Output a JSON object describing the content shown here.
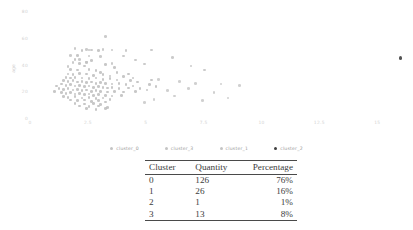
{
  "chart_data": {
    "type": "scatter",
    "title": "",
    "xlabel": "",
    "ylabel": "age",
    "xlim": [
      0,
      16.2
    ],
    "ylim": [
      0,
      84
    ],
    "xticks": [
      "0",
      "2.5",
      "5",
      "7.5",
      "10",
      "12.5",
      "15"
    ],
    "xtick_values": [
      0,
      2.5,
      5,
      7.5,
      10,
      12.5,
      15
    ],
    "yticks": [
      "80",
      "60",
      "40",
      "20",
      "0"
    ],
    "ytick_values": [
      80,
      60,
      40,
      20,
      0
    ],
    "grid": false,
    "legend_position": "bottom",
    "series": [
      {
        "name": "cluster_0",
        "color": "#bdbdbd",
        "points": [
          [
            1.95,
            44.0
          ],
          [
            2.15,
            41.0
          ],
          [
            2.45,
            41.5
          ],
          [
            2.35,
            39.0
          ],
          [
            1.75,
            36.5
          ],
          [
            2.05,
            36.0
          ],
          [
            2.55,
            36.5
          ],
          [
            2.85,
            35.5
          ],
          [
            3.05,
            34.0
          ],
          [
            1.65,
            33.0
          ],
          [
            1.85,
            32.5
          ],
          [
            2.15,
            33.5
          ],
          [
            2.45,
            33.0
          ],
          [
            2.75,
            32.0
          ],
          [
            3.15,
            32.5
          ],
          [
            3.45,
            31.5
          ],
          [
            1.55,
            30.5
          ],
          [
            1.75,
            30.0
          ],
          [
            1.95,
            30.5
          ],
          [
            2.25,
            30.0
          ],
          [
            2.55,
            29.5
          ],
          [
            2.85,
            30.0
          ],
          [
            3.15,
            29.0
          ],
          [
            3.45,
            29.5
          ],
          [
            3.75,
            28.5
          ],
          [
            1.45,
            28.0
          ],
          [
            1.65,
            27.5
          ],
          [
            1.85,
            28.0
          ],
          [
            2.05,
            27.0
          ],
          [
            2.25,
            27.5
          ],
          [
            2.45,
            26.5
          ],
          [
            2.65,
            27.0
          ],
          [
            2.85,
            26.0
          ],
          [
            3.05,
            26.5
          ],
          [
            3.25,
            26.0
          ],
          [
            3.55,
            25.5
          ],
          [
            3.85,
            26.0
          ],
          [
            4.15,
            25.0
          ],
          [
            1.35,
            25.5
          ],
          [
            1.55,
            24.5
          ],
          [
            1.75,
            25.0
          ],
          [
            1.95,
            24.0
          ],
          [
            2.15,
            24.5
          ],
          [
            2.35,
            23.5
          ],
          [
            2.55,
            24.0
          ],
          [
            2.75,
            23.0
          ],
          [
            2.95,
            23.5
          ],
          [
            3.15,
            23.0
          ],
          [
            3.35,
            22.5
          ],
          [
            3.55,
            23.0
          ],
          [
            3.85,
            22.0
          ],
          [
            4.25,
            22.5
          ],
          [
            1.25,
            22.0
          ],
          [
            1.45,
            21.5
          ],
          [
            1.65,
            22.0
          ],
          [
            1.85,
            21.0
          ],
          [
            2.05,
            21.5
          ],
          [
            2.25,
            20.5
          ],
          [
            2.45,
            21.0
          ],
          [
            2.65,
            20.0
          ],
          [
            2.85,
            20.5
          ],
          [
            3.05,
            20.0
          ],
          [
            3.35,
            19.5
          ],
          [
            3.65,
            20.0
          ],
          [
            4.05,
            19.5
          ],
          [
            4.55,
            20.0
          ],
          [
            1.35,
            19.0
          ],
          [
            1.55,
            18.5
          ],
          [
            1.75,
            19.0
          ],
          [
            1.95,
            18.0
          ],
          [
            2.15,
            18.5
          ],
          [
            2.35,
            17.5
          ],
          [
            2.55,
            18.0
          ],
          [
            2.75,
            17.0
          ],
          [
            2.95,
            17.5
          ],
          [
            3.25,
            17.0
          ],
          [
            3.55,
            16.5
          ],
          [
            3.95,
            17.0
          ],
          [
            1.45,
            16.0
          ],
          [
            1.65,
            15.5
          ],
          [
            1.95,
            16.0
          ],
          [
            2.25,
            15.0
          ],
          [
            2.55,
            15.5
          ],
          [
            2.85,
            14.5
          ],
          [
            3.15,
            15.0
          ],
          [
            3.45,
            14.0
          ],
          [
            1.75,
            13.5
          ],
          [
            2.05,
            13.0
          ],
          [
            2.35,
            13.5
          ],
          [
            2.65,
            12.5
          ],
          [
            2.95,
            13.0
          ],
          [
            3.25,
            12.0
          ],
          [
            1.95,
            11.0
          ],
          [
            2.35,
            10.5
          ],
          [
            2.75,
            11.0
          ],
          [
            3.05,
            10.0
          ],
          [
            2.15,
            9.0
          ],
          [
            2.55,
            8.5
          ],
          [
            2.95,
            9.0
          ],
          [
            3.35,
            8.0
          ],
          [
            2.45,
            7.0
          ],
          [
            2.85,
            6.5
          ],
          [
            3.25,
            7.0
          ],
          [
            1.15,
            24.0
          ],
          [
            1.05,
            20.0
          ],
          [
            4.45,
            24.0
          ],
          [
            4.75,
            22.0
          ],
          [
            5.05,
            21.0
          ],
          [
            4.35,
            28.0
          ],
          [
            4.65,
            27.0
          ],
          [
            5.15,
            25.0
          ],
          [
            5.45,
            23.5
          ],
          [
            4.05,
            31.0
          ],
          [
            4.45,
            30.0
          ],
          [
            5.25,
            28.5
          ],
          [
            3.75,
            34.0
          ],
          [
            4.25,
            33.0
          ],
          [
            2.65,
            43.0
          ],
          [
            3.25,
            40.0
          ],
          [
            3.65,
            38.0
          ],
          [
            2.05,
            47.0
          ],
          [
            2.25,
            50.5
          ],
          [
            2.55,
            51.0
          ],
          [
            2.95,
            50.5
          ]
        ]
      },
      {
        "name": "cluster_3",
        "color": "#c2c2c2",
        "points": [
          [
            3.25,
            61.0
          ],
          [
            1.95,
            52.0
          ],
          [
            2.45,
            51.5
          ],
          [
            2.65,
            51.0
          ],
          [
            3.15,
            51.5
          ],
          [
            3.55,
            51.0
          ],
          [
            4.15,
            50.5
          ],
          [
            5.25,
            51.0
          ],
          [
            1.75,
            47.0
          ],
          [
            2.55,
            46.5
          ],
          [
            3.05,
            46.0
          ],
          [
            4.05,
            46.5
          ],
          [
            6.15,
            45.5
          ],
          [
            1.85,
            41.5
          ],
          [
            2.45,
            42.0
          ],
          [
            3.55,
            41.0
          ],
          [
            4.95,
            40.5
          ],
          [
            6.95,
            39.0
          ],
          [
            7.55,
            36.0
          ],
          [
            2.15,
            44.0
          ],
          [
            4.55,
            43.5
          ],
          [
            1.65,
            38.5
          ]
        ]
      },
      {
        "name": "cluster_1",
        "color": "#c8c8c8",
        "points": [
          [
            5.55,
            29.0
          ],
          [
            6.45,
            27.5
          ],
          [
            7.15,
            26.0
          ],
          [
            8.25,
            25.5
          ],
          [
            9.05,
            24.5
          ],
          [
            6.85,
            22.0
          ],
          [
            5.95,
            20.5
          ],
          [
            7.95,
            19.0
          ],
          [
            6.25,
            16.5
          ],
          [
            8.55,
            15.0
          ],
          [
            5.35,
            14.0
          ],
          [
            7.45,
            13.0
          ],
          [
            4.95,
            11.5
          ]
        ]
      },
      {
        "name": "cluster_2",
        "color": "#4a4a4a",
        "points": [
          [
            16.0,
            45.0
          ]
        ]
      }
    ]
  },
  "legend": {
    "items": [
      {
        "label": "cluster_0",
        "marker": "dot-light"
      },
      {
        "label": "cluster_3",
        "marker": "dot-light"
      },
      {
        "label": "cluster_1",
        "marker": "dot-light"
      },
      {
        "label": "cluster_2",
        "marker": "dot-dark"
      }
    ]
  },
  "table": {
    "headers": [
      "Cluster",
      "Quantity",
      "Percentage"
    ],
    "rows": [
      {
        "cluster": "0",
        "quantity": "126",
        "percentage": "76%"
      },
      {
        "cluster": "1",
        "quantity": "26",
        "percentage": "16%"
      },
      {
        "cluster": "2",
        "quantity": "1",
        "percentage": "1%"
      },
      {
        "cluster": "3",
        "quantity": "13",
        "percentage": "8%"
      }
    ]
  }
}
